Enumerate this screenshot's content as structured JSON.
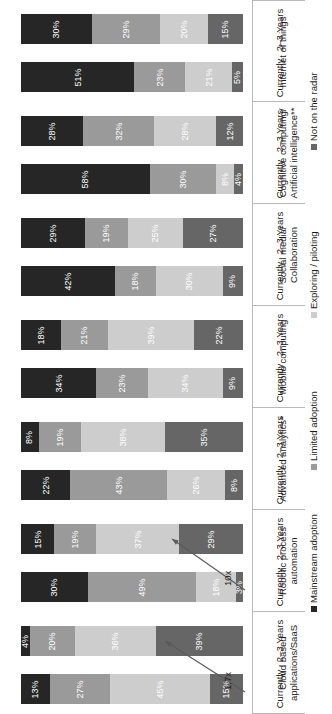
{
  "chart_data": {
    "type": "bar",
    "orientation": "horizontal-stacked-rotated",
    "title": "",
    "xlabel": "",
    "ylabel": "",
    "xlim": [
      0,
      100
    ],
    "grid": false,
    "legend_position": "right",
    "legend": [
      {
        "label": "Mainstream adoption",
        "color": "#262626"
      },
      {
        "label": "Limited adoption",
        "color": "#9a9a9a"
      },
      {
        "label": "Exploring / piloting",
        "color": "#cdcdcd"
      },
      {
        "label": "Not on the radar",
        "color": "#666666"
      }
    ],
    "series": [
      {
        "name": "Mainstream adoption",
        "color": "#262626"
      },
      {
        "name": "Limited adoption",
        "color": "#9a9a9a"
      },
      {
        "name": "Exploring / piloting",
        "color": "#cdcdcd"
      },
      {
        "name": "Not on the radar",
        "color": "#666666"
      }
    ],
    "tick_labels": [
      "2–3 Years",
      "Currently"
    ],
    "categories": [
      "Internet of things",
      "Cognitive computing/ Artificial intelligence**",
      "Social media/ Collaboration",
      "Mobile computing",
      "Advanced analytics*",
      "Robotic process automation",
      "Cloud based applications/SaaS"
    ],
    "groups": [
      {
        "category": "Internet of things",
        "category_lines": [
          "Internet of things"
        ],
        "rows": [
          {
            "tick": "2–3 Years",
            "values": [
              30,
              29,
              20,
              15
            ],
            "labels": [
              "30%",
              "29%",
              "20%",
              "15%"
            ]
          },
          {
            "tick": "Currently",
            "values": [
              51,
              23,
              21,
              5
            ],
            "labels": [
              "51%",
              "23%",
              "21%",
              "5%"
            ]
          }
        ]
      },
      {
        "category": "Cognitive computing/ Artificial intelligence**",
        "category_lines": [
          "Cognitive computing/",
          "Artificial intelligence**"
        ],
        "rows": [
          {
            "tick": "2–3 Years",
            "values": [
              28,
              32,
              28,
              12
            ],
            "labels": [
              "28%",
              "32%",
              "28%",
              "12%"
            ]
          },
          {
            "tick": "Currently",
            "values": [
              58,
              30,
              8,
              4
            ],
            "labels": [
              "58%",
              "30%",
              "8%",
              "4%"
            ]
          }
        ]
      },
      {
        "category": "Social media/ Collaboration",
        "category_lines": [
          "Social media/",
          "Collaboration"
        ],
        "rows": [
          {
            "tick": "2–3 Years",
            "values": [
              29,
              19,
              25,
              27
            ],
            "labels": [
              "29%",
              "19%",
              "25%",
              "27%"
            ]
          },
          {
            "tick": "Currently",
            "values": [
              42,
              18,
              30,
              9
            ],
            "labels": [
              "42%",
              "18%",
              "30%",
              "9%"
            ]
          }
        ]
      },
      {
        "category": "Mobile computing",
        "category_lines": [
          "Mobile computing"
        ],
        "rows": [
          {
            "tick": "2–3 Years",
            "values": [
              18,
              21,
              39,
              22
            ],
            "labels": [
              "18%",
              "21%",
              "39%",
              "22%"
            ]
          },
          {
            "tick": "Currently",
            "values": [
              34,
              23,
              34,
              9
            ],
            "labels": [
              "34%",
              "23%",
              "34%",
              "9%"
            ]
          }
        ]
      },
      {
        "category": "Advanced analytics*",
        "category_lines": [
          "Advanced analytics*"
        ],
        "rows": [
          {
            "tick": "2–3 Years",
            "values": [
              8,
              19,
              38,
              35
            ],
            "labels": [
              "8%",
              "19%",
              "38%",
              "35%"
            ]
          },
          {
            "tick": "Currently",
            "values": [
              22,
              43,
              26,
              8
            ],
            "labels": [
              "22%",
              "43%",
              "26%",
              "8%"
            ]
          }
        ]
      },
      {
        "category": "Robotic process automation",
        "category_lines": [
          "Robotic process",
          "automation"
        ],
        "rows": [
          {
            "tick": "2–3 Years",
            "values": [
              15,
              19,
              37,
              29
            ],
            "labels": [
              "15%",
              "19%",
              "37%",
              "29%"
            ]
          },
          {
            "tick": "Currently",
            "values": [
              30,
              49,
              18,
              3
            ],
            "labels": [
              "30%",
              "49%",
              "18%",
              "3%"
            ]
          }
        ]
      },
      {
        "category": "Cloud based applications/SaaS",
        "category_lines": [
          "Cloud based",
          "applications/SaaS"
        ],
        "rows": [
          {
            "tick": "2–3 Years",
            "values": [
              4,
              20,
              36,
              39
            ],
            "labels": [
              "4%",
              "20%",
              "36%",
              "39%"
            ]
          },
          {
            "tick": "Currently",
            "values": [
              13,
              27,
              45,
              15
            ],
            "labels": [
              "13%",
              "27%",
              "45%",
              "15%"
            ]
          }
        ]
      }
    ],
    "annotations": [
      {
        "text": "10x",
        "group": "Robotic process automation"
      },
      {
        "text": "1.7x",
        "group": "Cloud based applications/SaaS"
      }
    ]
  }
}
